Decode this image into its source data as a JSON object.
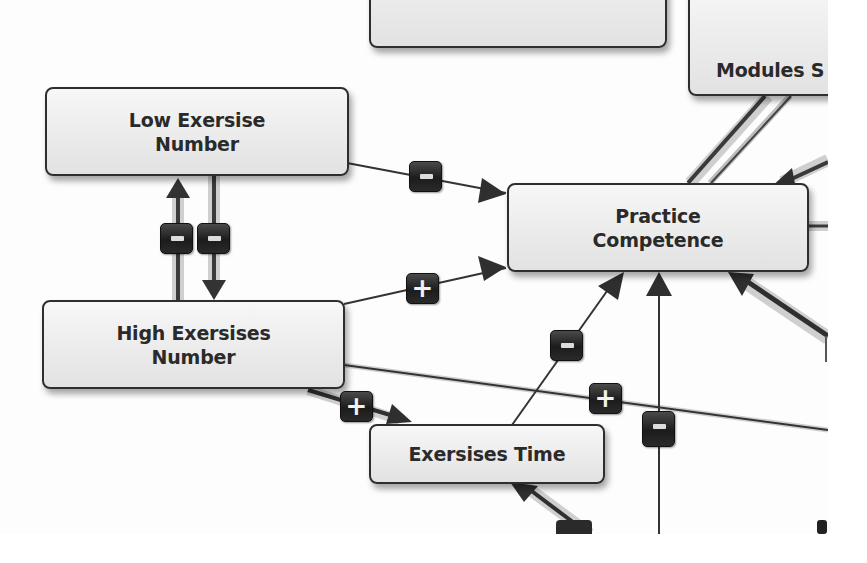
{
  "diagram": {
    "type": "causal-loop-diagram",
    "nodes": [
      {
        "id": "top-box",
        "label": ""
      },
      {
        "id": "modules",
        "label": "Modules S"
      },
      {
        "id": "low-exersise-number",
        "label": "Low Exersise\nNumber"
      },
      {
        "id": "practice-competence",
        "label": "Practice\nCompetence"
      },
      {
        "id": "high-exersises-number",
        "label": "High Exersises\nNumber"
      },
      {
        "id": "exersises-time",
        "label": "Exersises Time"
      }
    ],
    "edges": [
      {
        "from": "low-exersise-number",
        "to": "practice-competence",
        "polarity": "-"
      },
      {
        "from": "high-exersises-number",
        "to": "practice-competence",
        "polarity": "+"
      },
      {
        "from": "high-exersises-number",
        "to": "low-exersise-number",
        "polarity": "-"
      },
      {
        "from": "low-exersise-number",
        "to": "high-exersises-number",
        "polarity": "-"
      },
      {
        "from": "high-exersises-number",
        "to": "exersises-time",
        "polarity": "+"
      },
      {
        "from": "exersises-time",
        "to": "practice-competence",
        "polarity": "-"
      },
      {
        "from": "high-exersises-number",
        "to": "offscreen-right",
        "polarity": "+"
      },
      {
        "from": "offscreen-bottom",
        "to": "practice-competence",
        "polarity": "-"
      },
      {
        "from": "offscreen-bottom",
        "to": "exersises-time",
        "polarity": ""
      },
      {
        "from": "modules",
        "to": "practice-competence",
        "polarity": ""
      },
      {
        "from": "offscreen-right",
        "to": "practice-competence",
        "polarity": ""
      }
    ],
    "badges": {
      "minus": "−",
      "plus": "+"
    }
  }
}
